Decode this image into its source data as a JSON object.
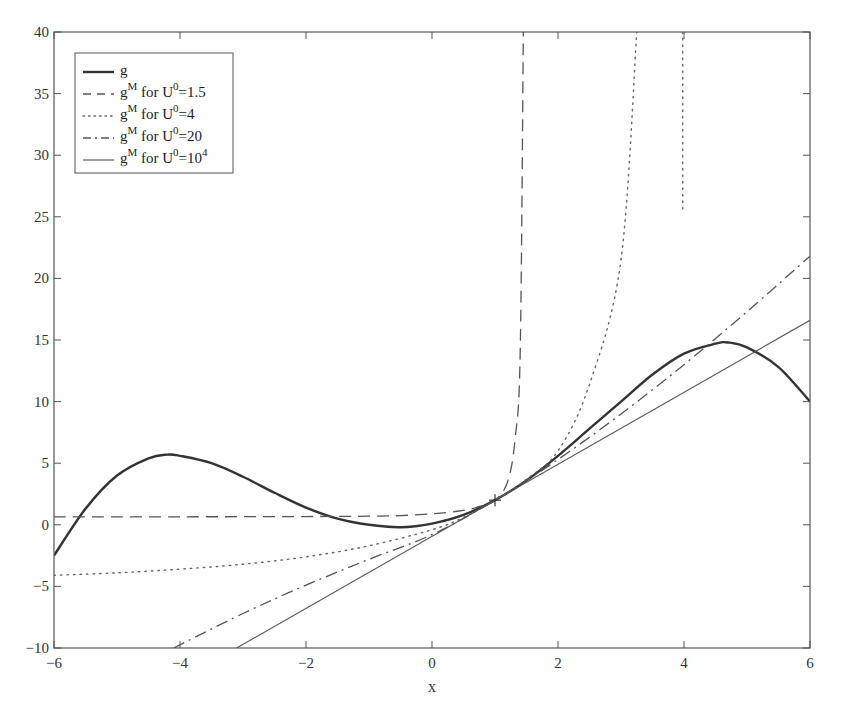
{
  "chart_data": {
    "type": "line",
    "title": "",
    "xlabel": "x",
    "ylabel": "",
    "xlim": [
      -6,
      6
    ],
    "ylim": [
      -10,
      40
    ],
    "grid": false,
    "legend_position": "upper-left",
    "xticks": [
      -6,
      -4,
      -2,
      0,
      2,
      4,
      6
    ],
    "xtick_labels": [
      "−6",
      "−4",
      "−2",
      "0",
      "2",
      "4",
      "6"
    ],
    "yticks": [
      -10,
      -5,
      0,
      5,
      10,
      15,
      20,
      25,
      30,
      35,
      40
    ],
    "ytick_labels": [
      "−10",
      "−5",
      "0",
      "5",
      "10",
      "15",
      "20",
      "25",
      "30",
      "35",
      "40"
    ],
    "marker_point": {
      "x": 1,
      "y": 2,
      "marker": "+"
    },
    "series": [
      {
        "name": "g",
        "legend_base": "g",
        "legend_rest": "",
        "style": "solid-thick",
        "segments": [
          {
            "x": [
              -6,
              -5.5,
              -5,
              -4.5,
              -4.2,
              -4,
              -3.5,
              -3,
              -2.5,
              -2,
              -1.5,
              -1,
              -0.5,
              0,
              0.5,
              1,
              1.5,
              2,
              2.5,
              3,
              3.5,
              4,
              4.5,
              4.7,
              5,
              5.5,
              6
            ],
            "y": [
              -2.5,
              1.3,
              4.0,
              5.4,
              5.7,
              5.6,
              5.0,
              3.9,
              2.6,
              1.4,
              0.5,
              0.0,
              -0.2,
              0.1,
              0.8,
              2.0,
              3.6,
              5.6,
              7.8,
              10.0,
              12.2,
              13.9,
              14.7,
              14.8,
              14.4,
              12.8,
              10.0
            ]
          }
        ]
      },
      {
        "name": "g^M for U^0=1.5",
        "legend_base": "g",
        "legend_sup": "M",
        "legend_mid": " for U",
        "legend_sup2": "0",
        "legend_rest": "=1.5",
        "style": "dashed",
        "segments": [
          {
            "x": [
              -6,
              -4,
              -2,
              -1,
              -0.5,
              0,
              0.4,
              0.7,
              1.0,
              1.2,
              1.32,
              1.4,
              1.45
            ],
            "y": [
              0.65,
              0.65,
              0.67,
              0.7,
              0.75,
              0.9,
              1.1,
              1.4,
              2.0,
              3.5,
              7,
              14,
              40
            ]
          }
        ]
      },
      {
        "name": "g^M for U^0=4",
        "legend_base": "g",
        "legend_sup": "M",
        "legend_mid": " for U",
        "legend_sup2": "0",
        "legend_rest": "=4",
        "style": "dotted",
        "segments": [
          {
            "x": [
              -6,
              -5,
              -4,
              -3,
              -2,
              -1,
              0,
              0.5,
              1,
              1.5,
              2,
              2.5,
              3,
              3.25
            ],
            "y": [
              -4.1,
              -3.9,
              -3.6,
              -3.2,
              -2.6,
              -1.7,
              -0.4,
              0.6,
              2.0,
              3.7,
              6.0,
              11.4,
              21.5,
              40
            ]
          },
          {
            "x": [
              3.98,
              3.98
            ],
            "y": [
              40,
              25.3
            ]
          }
        ]
      },
      {
        "name": "g^M for U^0=20",
        "legend_base": "g",
        "legend_sup": "M",
        "legend_mid": " for U",
        "legend_sup2": "0",
        "legend_rest": "=20",
        "style": "dashdot",
        "segments": [
          {
            "x": [
              -4.1,
              -3,
              -2,
              -1,
              0,
              1,
              2,
              3,
              4,
              5,
              6
            ],
            "y": [
              -10,
              -7.2,
              -4.9,
              -2.8,
              -0.8,
              2.0,
              5.3,
              9.0,
              13.0,
              17.3,
              21.8
            ]
          }
        ]
      },
      {
        "name": "g^M for U^0=10^4",
        "legend_base": "g",
        "legend_sup": "M",
        "legend_mid": " for U",
        "legend_sup2": "0",
        "legend_rest": "=10",
        "legend_sup3": "4",
        "style": "solid-thin",
        "segments": [
          {
            "x": [
              -3.1,
              6
            ],
            "y": [
              -10,
              16.6
            ]
          }
        ]
      }
    ]
  },
  "colors": {
    "axis": "#555555",
    "line": "#333333",
    "thin_line": "#555555"
  }
}
